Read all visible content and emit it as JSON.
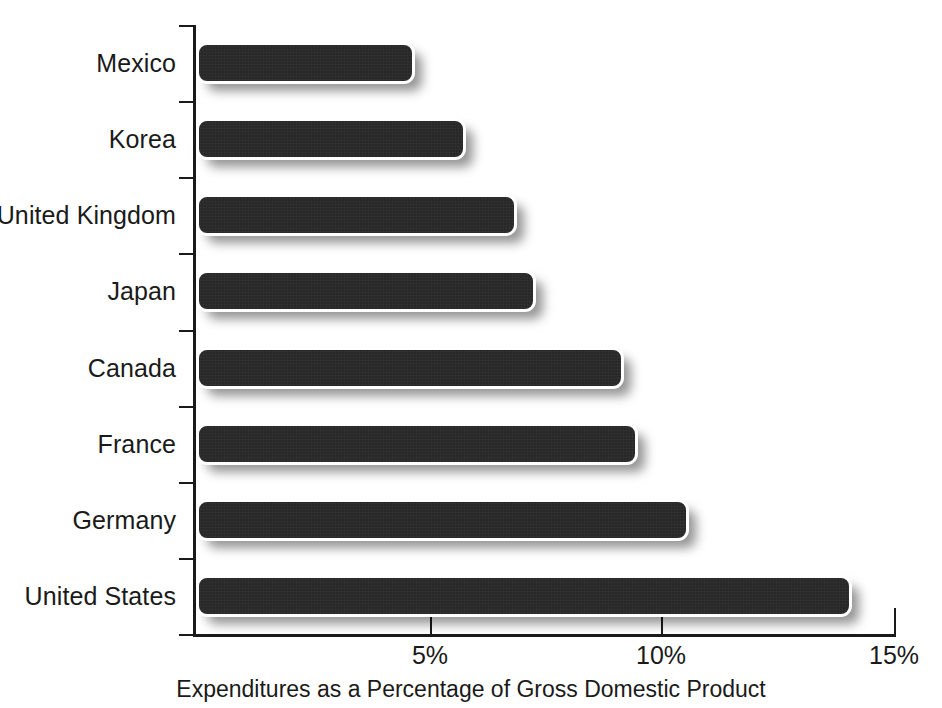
{
  "chart_data": {
    "type": "bar",
    "orientation": "horizontal",
    "title": "",
    "subtitle": "",
    "xlabel": "Expenditures as a Percentage of Gross Domestic Product",
    "ylabel": "",
    "categories": [
      "Mexico",
      "Korea",
      "United Kingdom",
      "Japan",
      "Canada",
      "France",
      "Germany",
      "United States"
    ],
    "values": [
      4.7,
      5.8,
      6.9,
      7.3,
      9.2,
      9.5,
      10.6,
      14.1
    ],
    "value_unit": "%",
    "xlim": [
      0,
      15
    ],
    "xticks": [
      5,
      10,
      15
    ],
    "xticklabels": [
      "5%",
      "10%",
      "15%"
    ],
    "grid": false,
    "legend": null,
    "series": [
      {
        "name": "Health care expenditures as a percentage of GDP",
        "values": [
          4.7,
          5.8,
          6.9,
          7.3,
          9.2,
          9.5,
          10.6,
          14.1
        ]
      }
    ],
    "colors": {
      "bar_fill": "#2b2b2b",
      "bar_outline": "#ffffff",
      "axis": "#1a1a1a",
      "text": "#1a1a1a",
      "background": "#ffffff"
    }
  },
  "axis": {
    "x_title": "Expenditures as a Percentage of Gross Domestic Product",
    "tick_labels": [
      "5%",
      "10%",
      "15%"
    ]
  }
}
